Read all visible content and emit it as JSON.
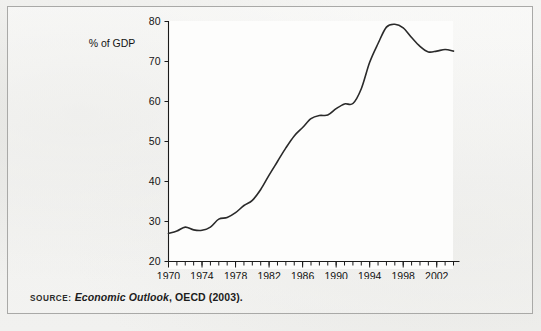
{
  "figure": {
    "source_kicker": "SOURCE:",
    "source_title": "Economic Outlook",
    "source_rest": ", OECD (2003)."
  },
  "chart_data": {
    "type": "line",
    "title": "",
    "subtitle": "",
    "xlabel": "",
    "ylabel": "% of GDP",
    "ylim": [
      20,
      80
    ],
    "xlim": [
      1970,
      2004
    ],
    "ytick_values": [
      20,
      30,
      40,
      50,
      60,
      70,
      80
    ],
    "ytick_labels": [
      "20",
      "30",
      "40",
      "50",
      "60",
      "70",
      "80"
    ],
    "xtick_values": [
      1970,
      1974,
      1978,
      1982,
      1986,
      1990,
      1994,
      1998,
      2002
    ],
    "xtick_labels": [
      "1970",
      "1974",
      "1978",
      "1982",
      "1986",
      "1990",
      "1994",
      "1998",
      "2002"
    ],
    "minor_xticks_every": 1,
    "grid": false,
    "legend": null,
    "legend_position": "none",
    "line_color": "#2a2a2a",
    "series": [
      {
        "name": "Gross public debt",
        "x": [
          1970,
          1971,
          1972,
          1973,
          1974,
          1975,
          1976,
          1977,
          1978,
          1979,
          1980,
          1981,
          1982,
          1983,
          1984,
          1985,
          1986,
          1987,
          1988,
          1989,
          1990,
          1991,
          1992,
          1993,
          1994,
          1995,
          1996,
          1997,
          1998,
          1999,
          2000,
          2001,
          2002,
          2003,
          2004
        ],
        "values": [
          27.0,
          27.6,
          28.6,
          27.9,
          27.8,
          28.6,
          30.6,
          31.0,
          32.2,
          34.0,
          35.3,
          38.0,
          41.6,
          45.0,
          48.4,
          51.4,
          53.5,
          55.7,
          56.5,
          56.6,
          58.2,
          59.4,
          59.5,
          63.2,
          69.8,
          74.5,
          78.6,
          79.3,
          78.4,
          76.0,
          73.8,
          72.4,
          72.6,
          73.0,
          72.6
        ]
      }
    ]
  }
}
